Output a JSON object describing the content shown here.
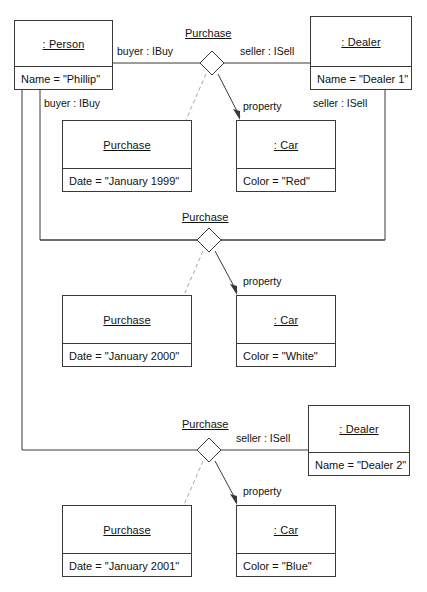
{
  "diagram": {
    "line_color": "#3a3a3a",
    "dashed_color": "#a0a0a0",
    "objects": [
      {
        "id": "person",
        "name": ": Person",
        "attr": "Name = \"Phillip\""
      },
      {
        "id": "dealer1",
        "name": ": Dealer",
        "attr": "Name = \"Dealer 1\""
      },
      {
        "id": "dealer2",
        "name": ": Dealer",
        "attr": "Name = \"Dealer 2\""
      },
      {
        "id": "purchase1",
        "name": "Purchase",
        "attr": "Date = \"January 1999\""
      },
      {
        "id": "purchase2",
        "name": "Purchase",
        "attr": "Date = \"January 2000\""
      },
      {
        "id": "purchase3",
        "name": "Purchase",
        "attr": "Date = \"January 2001\""
      },
      {
        "id": "car1",
        "name": ": Car",
        "attr": "Color = \"Red\""
      },
      {
        "id": "car2",
        "name": ": Car",
        "attr": "Color = \"White\""
      },
      {
        "id": "car3",
        "name": ": Car",
        "attr": "Color = \"Blue\""
      }
    ],
    "associations": [
      {
        "id": "assoc1",
        "label": "Purchase"
      },
      {
        "id": "assoc2",
        "label": "Purchase"
      },
      {
        "id": "assoc3",
        "label": "Purchase"
      }
    ],
    "role_labels": {
      "buyer_top": "buyer : IBuy",
      "seller_top": "seller : ISell",
      "buyer_inner": "buyer : IBuy",
      "seller_inner": "seller : ISell",
      "seller_bottom": "seller : ISell",
      "property_1": "property",
      "property_2": "property",
      "property_3": "property"
    },
    "caption": ""
  }
}
